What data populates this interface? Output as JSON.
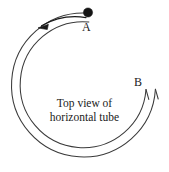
{
  "figure": {
    "background_color": "#ffffff",
    "stroke_color": "#3a3a3a",
    "ball_color": "#141414",
    "labels": {
      "point_a": "A",
      "point_b": "B"
    },
    "caption": {
      "line1": "Top view of",
      "line2": "horizontal tube"
    },
    "geometry": {
      "center_x": 84,
      "center_y": 85,
      "outer_radius": 72,
      "inner_radius": 63,
      "gap_start_deg": -76,
      "gap_end_deg": -5
    },
    "ball": {
      "cx": 88,
      "cy": 12,
      "r": 4.5
    },
    "motion_arrow": {
      "direction": "counterclockwise",
      "tip_x": 39,
      "tip_y": 26
    }
  }
}
